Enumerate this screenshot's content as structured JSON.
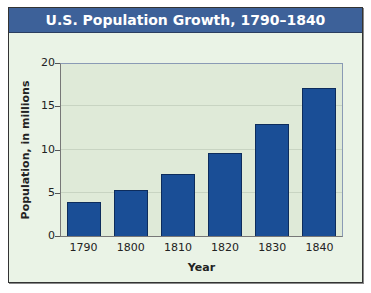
{
  "title": "U.S. Population Growth, 1790–1840",
  "colors": {
    "title_bar": "#3d6199",
    "bar": "#1a4e96",
    "background": "#eaf3e6",
    "plot_background": "#dfead8"
  },
  "axes": {
    "x_title": "Year",
    "y_title": "Population, in millions",
    "y_ticks": [
      "0",
      "5",
      "10",
      "15",
      "20"
    ],
    "x_ticks": [
      "1790",
      "1800",
      "1810",
      "1820",
      "1830",
      "1840"
    ]
  },
  "chart_data": {
    "type": "bar",
    "title": "U.S. Population Growth, 1790–1840",
    "xlabel": "Year",
    "ylabel": "Population, in millions",
    "categories": [
      "1790",
      "1800",
      "1810",
      "1820",
      "1830",
      "1840"
    ],
    "values": [
      3.9,
      5.3,
      7.2,
      9.6,
      12.9,
      17.1
    ],
    "ylim": [
      0,
      20
    ],
    "yticks": [
      0,
      5,
      10,
      15,
      20
    ],
    "grid": true,
    "legend": null
  }
}
